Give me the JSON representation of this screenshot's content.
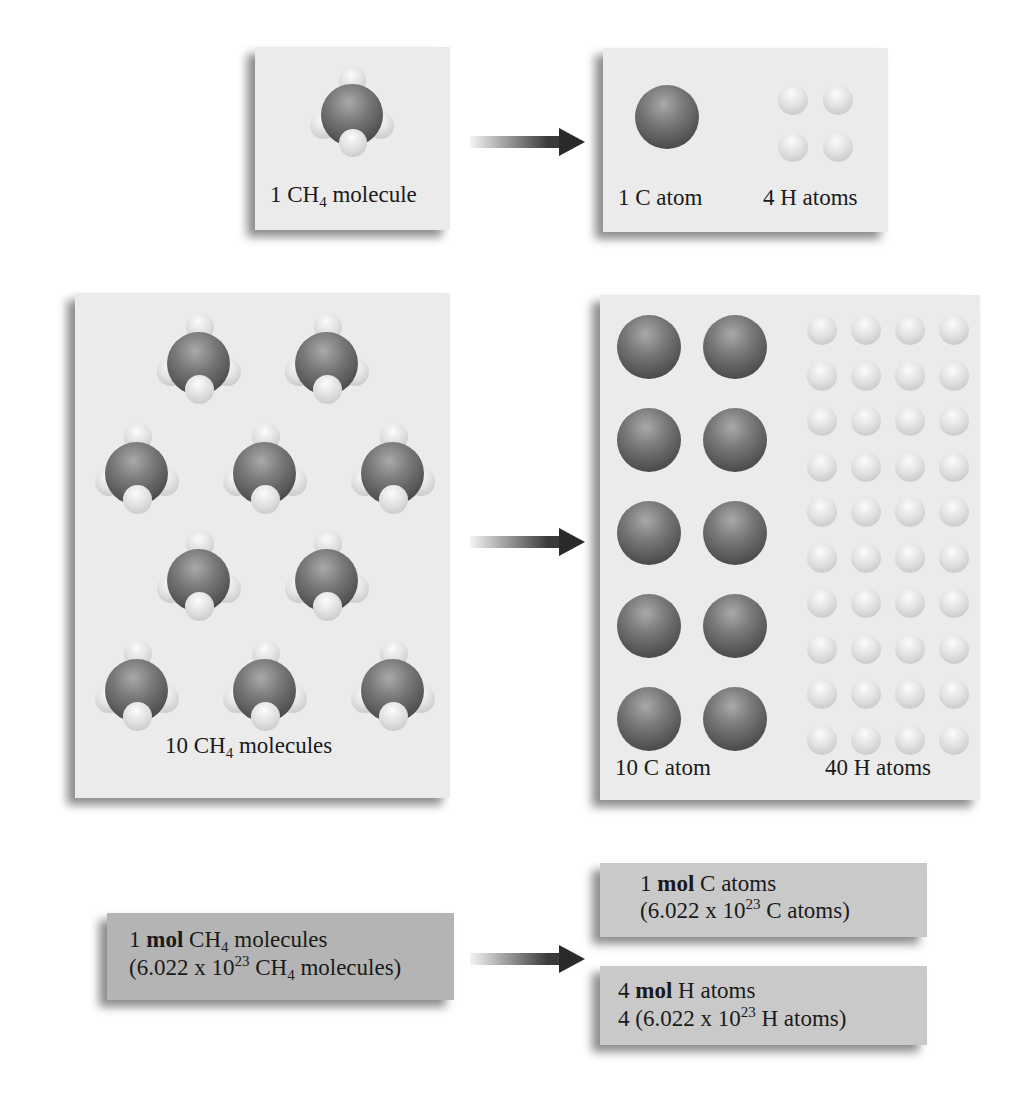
{
  "row1": {
    "left_label": {
      "prefix": "1 CH",
      "sub": "4",
      "suffix": " molecule"
    },
    "right_labels": {
      "c": "1 C atom",
      "h": "4 H atoms"
    },
    "counts": {
      "molecules": 1,
      "c_atoms": 1,
      "h_atoms": 4
    }
  },
  "row2": {
    "left_label": {
      "prefix": "10 CH",
      "sub": "4",
      "suffix": " molecules"
    },
    "right_labels": {
      "c": "10 C atom",
      "h": "40 H atoms"
    },
    "counts": {
      "molecules": 10,
      "c_atoms": 10,
      "h_atoms": 40
    }
  },
  "row3": {
    "left": {
      "line1": {
        "num": "1 ",
        "bold": "mol",
        "rest": " CH",
        "sub": "4",
        "tail": " molecules"
      },
      "line2": {
        "pre": "(6.022 x 10",
        "sup": "23",
        "mid": " CH",
        "sub": "4",
        "tail": " molecules)"
      }
    },
    "right_top": {
      "line1": {
        "num": "1 ",
        "bold": "mol",
        "rest": " C atoms"
      },
      "line2": {
        "pre": "(6.022 x 10",
        "sup": "23",
        "tail": " C atoms)"
      }
    },
    "right_bottom": {
      "line1": {
        "num": "4 ",
        "bold": "mol",
        "rest": " H atoms"
      },
      "line2": {
        "pre": "4 (6.022 x 10",
        "sup": "23",
        "tail": " H atoms)"
      }
    }
  },
  "colors": {
    "panel_light": "#ebebeb",
    "panel_dark": "#b4b4b4",
    "panel_mid": "#c9c9c9",
    "carbon": "#555555",
    "hydrogen": "#e0e0e0",
    "arrow": "#2a2a2a"
  }
}
